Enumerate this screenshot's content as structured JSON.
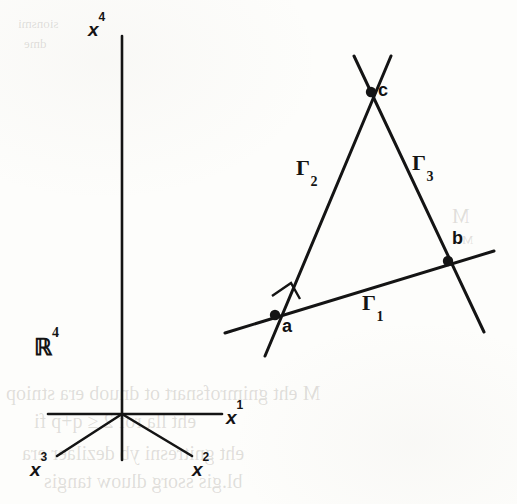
{
  "figure": {
    "ambient_space": {
      "symbol": "ℝ",
      "exponent": "4"
    },
    "axes": [
      {
        "name": "x1",
        "label": "x",
        "exponent": "1",
        "direction": "right",
        "x1": 48,
        "y1": 414,
        "x2": 222,
        "y2": 414,
        "label_x": 226,
        "label_y": 406
      },
      {
        "name": "x2",
        "label": "x",
        "exponent": "2",
        "direction": "down-right",
        "x1": 122,
        "y1": 414,
        "x2": 192,
        "y2": 456,
        "label_x": 192,
        "label_y": 458
      },
      {
        "name": "x3",
        "label": "x",
        "exponent": "3",
        "direction": "down-left",
        "x1": 122,
        "y1": 414,
        "x2": 57,
        "y2": 456,
        "label_x": 30,
        "label_y": 458
      },
      {
        "name": "x4",
        "label": "x",
        "exponent": "4",
        "direction": "up",
        "x1": 122,
        "y1": 36,
        "x2": 122,
        "y2": 460,
        "label_x": 88,
        "label_y": 18
      }
    ],
    "origin": {
      "x": 122,
      "y": 414
    },
    "curves": [
      {
        "name": "Gamma1",
        "label": "Γ",
        "subscript": "1",
        "x1": 225,
        "y1": 333,
        "x2": 494,
        "y2": 251,
        "label_x": 362,
        "label_y": 290
      },
      {
        "name": "Gamma2",
        "label": "Γ",
        "subscript": "2",
        "x1": 265,
        "y1": 356,
        "x2": 391,
        "y2": 56,
        "label_x": 296,
        "label_y": 155
      },
      {
        "name": "Gamma3",
        "label": "Γ",
        "subscript": "3",
        "x1": 354,
        "y1": 56,
        "x2": 484,
        "y2": 332,
        "label_x": 412,
        "label_y": 150
      }
    ],
    "vertices": [
      {
        "name": "a",
        "label": "a",
        "x": 275,
        "y": 315,
        "label_x": 282,
        "label_y": 316
      },
      {
        "name": "b",
        "label": "b",
        "x": 448,
        "y": 261,
        "label_x": 452,
        "label_y": 228
      },
      {
        "name": "c",
        "label": "c",
        "x": 371,
        "y": 92,
        "label_x": 378,
        "label_y": 80
      }
    ],
    "right_angle": {
      "name": "right-angle-marker-at-a",
      "points": "272,296 291,283 300,299"
    },
    "colors": {
      "ink": "#141414",
      "paper": "#fdfdfb"
    },
    "stroke_widths": {
      "axis": 2.6,
      "curve": 3.0
    }
  },
  "bleed_through": [
    {
      "text": "sionsmi",
      "x": 18,
      "y": 16,
      "size": "small"
    },
    {
      "text": "dme",
      "x": 24,
      "y": 36,
      "size": "small"
    },
    {
      "text": "M",
      "x": 452,
      "y": 205,
      "size": "big"
    },
    {
      "text": "M",
      "x": 462,
      "y": 232,
      "size": "small"
    },
    {
      "text": "M eht  gnimrofsnart  ot dnuob era stniop",
      "x": 6,
      "y": 382,
      "size": "big"
    },
    {
      "text": "eht  lla  rof  2 ≤ q+p  fi",
      "x": 34,
      "y": 410,
      "size": "big"
    },
    {
      "text": "eht gnitresni yb dezilaer era",
      "x": 22,
      "y": 442,
      "size": "big"
    },
    {
      "text": "bl.gis  ssorg  dluow  tangis",
      "x": 44,
      "y": 470,
      "size": "big"
    }
  ]
}
